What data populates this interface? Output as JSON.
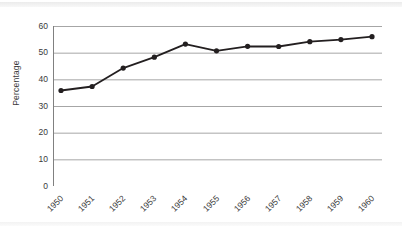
{
  "figure": {
    "background_color": "#ffffff",
    "axis_color": "#808080",
    "grid_color": "#a6a6a6",
    "series_color": "#231f20"
  },
  "chart_data": {
    "type": "line",
    "title": "",
    "xlabel": "",
    "ylabel": "Percentage",
    "categories": [
      "1950",
      "1951",
      "1952",
      "1953",
      "1954",
      "1955",
      "1956",
      "1957",
      "1958",
      "1959",
      "1960"
    ],
    "values": [
      35.8,
      37.3,
      44.2,
      48.3,
      53.2,
      50.7,
      52.4,
      52.3,
      54.1,
      54.9,
      56.0
    ],
    "ylim": [
      0,
      60
    ],
    "yticks": [
      0,
      10,
      20,
      30,
      40,
      50,
      60
    ],
    "ytick_labels": [
      "0",
      "10",
      "20",
      "30",
      "40",
      "50",
      "60"
    ],
    "grid": "horizontal",
    "legend": "none",
    "marker": "filled-circle",
    "line_color": "#231f20",
    "marker_color": "#231f20"
  }
}
